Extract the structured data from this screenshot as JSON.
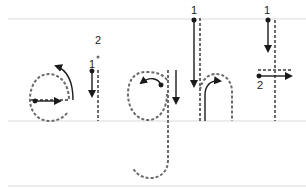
{
  "worksheet": {
    "word": "eight",
    "letters": [
      {
        "char": "e",
        "steps": [
          {
            "number": "1",
            "direction": "right-then-around"
          }
        ]
      },
      {
        "char": "i",
        "steps": [
          {
            "number": "1",
            "direction": "down"
          },
          {
            "number": "2",
            "direction": "dot"
          }
        ]
      },
      {
        "char": "g",
        "steps": [
          {
            "number": "1",
            "direction": "around-then-down"
          }
        ]
      },
      {
        "char": "h",
        "steps": [
          {
            "number": "1",
            "direction": "down-then-hump"
          }
        ]
      },
      {
        "char": "t",
        "steps": [
          {
            "number": "1",
            "direction": "down"
          },
          {
            "number": "2",
            "direction": "right"
          }
        ]
      }
    ],
    "labels": {
      "e_1": "1",
      "i_1": "1",
      "i_2": "2",
      "h_1": "1",
      "t_1": "1",
      "t_2": "2"
    },
    "colors": {
      "guide_line": "#ececec",
      "trace_dash": "#6a6a6a",
      "arrow": "#1a1a1a",
      "background": "#ffffff"
    }
  }
}
